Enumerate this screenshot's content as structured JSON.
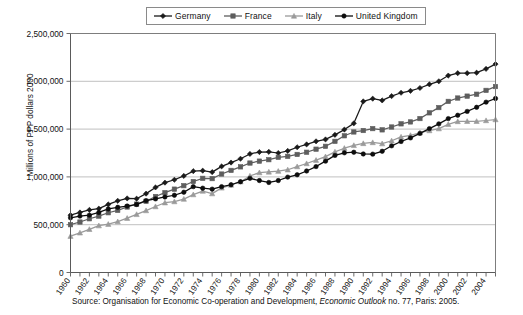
{
  "chart_data": {
    "type": "line",
    "title": "",
    "xlabel": "",
    "ylabel": "Millions of PPP dollars 2000",
    "xlim": [
      1960,
      2005
    ],
    "ylim": [
      0,
      2500000
    ],
    "ytick_labels": [
      "2,500,000",
      "2,000,000",
      "1,500,000",
      "1,000,000",
      "500,000",
      "0"
    ],
    "ytick_values": [
      2500000,
      2000000,
      1500000,
      1000000,
      500000,
      0
    ],
    "xtick_labels": [
      "1960",
      "1962",
      "1964",
      "1966",
      "1968",
      "1970",
      "1972",
      "1974",
      "1976",
      "1978",
      "1980",
      "1982",
      "1984",
      "1986",
      "1988",
      "1990",
      "1992",
      "1994",
      "1996",
      "1998",
      "2000",
      "2002",
      "2004"
    ],
    "grid": "horizontal",
    "legend_position": "top-center",
    "x": [
      1960,
      1961,
      1962,
      1963,
      1964,
      1965,
      1966,
      1967,
      1968,
      1969,
      1970,
      1971,
      1972,
      1973,
      1974,
      1975,
      1976,
      1977,
      1978,
      1979,
      1980,
      1981,
      1982,
      1983,
      1984,
      1985,
      1986,
      1987,
      1988,
      1989,
      1990,
      1991,
      1992,
      1993,
      1994,
      1995,
      1996,
      1997,
      1998,
      1999,
      2000,
      2001,
      2002,
      2003,
      2004,
      2005
    ],
    "series": [
      {
        "name": "Germany",
        "marker": "diamond",
        "color": "#1a1a1a",
        "values": [
          600000,
          628000,
          655000,
          668000,
          712000,
          750000,
          775000,
          772000,
          825000,
          890000,
          940000,
          970000,
          1010000,
          1060000,
          1065000,
          1050000,
          1110000,
          1150000,
          1190000,
          1240000,
          1260000,
          1262000,
          1250000,
          1272000,
          1310000,
          1340000,
          1372000,
          1392000,
          1440000,
          1495000,
          1560000,
          1790000,
          1818000,
          1800000,
          1845000,
          1880000,
          1900000,
          1930000,
          1968000,
          2000000,
          2060000,
          2085000,
          2085000,
          2090000,
          2130000,
          2180000
        ]
      },
      {
        "name": "France",
        "marker": "square",
        "color": "#5e5e5e",
        "values": [
          500000,
          528000,
          562000,
          590000,
          625000,
          650000,
          685000,
          715000,
          745000,
          795000,
          835000,
          872000,
          908000,
          952000,
          985000,
          982000,
          1030000,
          1068000,
          1105000,
          1145000,
          1165000,
          1180000,
          1205000,
          1215000,
          1235000,
          1258000,
          1290000,
          1320000,
          1372000,
          1430000,
          1470000,
          1485000,
          1505000,
          1492000,
          1522000,
          1555000,
          1575000,
          1610000,
          1670000,
          1725000,
          1790000,
          1825000,
          1845000,
          1865000,
          1905000,
          1945000
        ]
      },
      {
        "name": "Italy",
        "marker": "triangle",
        "color": "#9a9a9a",
        "values": [
          380000,
          415000,
          452000,
          490000,
          505000,
          532000,
          568000,
          608000,
          648000,
          690000,
          730000,
          742000,
          768000,
          815000,
          852000,
          825000,
          885000,
          915000,
          950000,
          1010000,
          1045000,
          1052000,
          1060000,
          1075000,
          1108000,
          1140000,
          1175000,
          1212000,
          1262000,
          1300000,
          1330000,
          1350000,
          1360000,
          1348000,
          1378000,
          1418000,
          1435000,
          1462000,
          1485000,
          1505000,
          1550000,
          1580000,
          1582000,
          1582000,
          1590000,
          1600000
        ]
      },
      {
        "name": "United Kingdom",
        "marker": "circle",
        "color": "#0d0d0d",
        "values": [
          572000,
          590000,
          600000,
          628000,
          665000,
          682000,
          695000,
          712000,
          752000,
          770000,
          790000,
          808000,
          840000,
          898000,
          882000,
          872000,
          898000,
          918000,
          950000,
          985000,
          962000,
          942000,
          962000,
          998000,
          1022000,
          1062000,
          1108000,
          1165000,
          1225000,
          1252000,
          1258000,
          1240000,
          1238000,
          1268000,
          1325000,
          1370000,
          1408000,
          1455000,
          1505000,
          1555000,
          1610000,
          1645000,
          1685000,
          1728000,
          1782000,
          1820000
        ]
      }
    ]
  },
  "legend": {
    "entries": [
      {
        "label": "Germany",
        "marker": "diamond",
        "color": "#1a1a1a"
      },
      {
        "label": "France",
        "marker": "square",
        "color": "#5e5e5e"
      },
      {
        "label": "Italy",
        "marker": "triangle",
        "color": "#9a9a9a"
      },
      {
        "label": "United Kingdom",
        "marker": "circle",
        "color": "#0d0d0d"
      }
    ]
  },
  "source": {
    "prefix": "Source: Organisation for Economic Co-operation and Development, ",
    "italic": "Economic Outlook",
    "suffix": " no. 77, Paris: 2005."
  },
  "colors": {
    "background": "#ffffff",
    "grid": "#b0b0b0",
    "axis": "#5a5a5a",
    "frame": "#7d7d7d"
  }
}
